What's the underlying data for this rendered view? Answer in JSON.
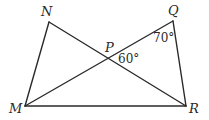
{
  "diagram": {
    "points": {
      "N": {
        "label": "N",
        "x": 49,
        "y": 22
      },
      "Q": {
        "label": "Q",
        "x": 173,
        "y": 21
      },
      "P": {
        "label": "P",
        "x": 109,
        "y": 58
      },
      "M": {
        "label": "M",
        "x": 25,
        "y": 106
      },
      "R": {
        "label": "R",
        "x": 186,
        "y": 106
      }
    },
    "segments": [
      "MN",
      "NR",
      "MQ",
      "QR",
      "MR"
    ],
    "angles": {
      "Q": {
        "label": "70°"
      },
      "P": {
        "label": "60°"
      }
    },
    "colors": {
      "stroke": "#2a2a2a",
      "background": "#ffffff"
    }
  }
}
